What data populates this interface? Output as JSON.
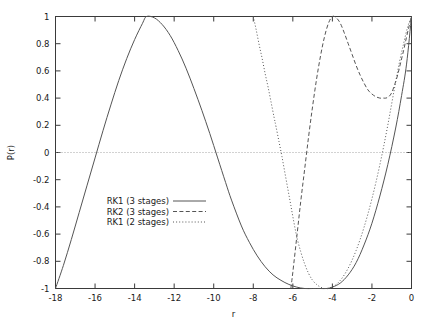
{
  "chart_data": {
    "type": "line",
    "title": "",
    "subtitle": "",
    "xlabel": "r",
    "ylabel": "P(r)",
    "xlim": [
      -18,
      0
    ],
    "ylim": [
      -1,
      1
    ],
    "grid": false,
    "zero_line": true,
    "legend_position": "center-left-inside",
    "xticks": [
      -18,
      -16,
      -14,
      -12,
      -10,
      -8,
      -6,
      -4,
      -2,
      0
    ],
    "xtick_labels": [
      "-18",
      "-16",
      "-14",
      "-12",
      "-10",
      "-8",
      "-6",
      "-4",
      "-2",
      "0"
    ],
    "yticks": [
      -1,
      -0.8,
      -0.6,
      -0.4,
      -0.2,
      0,
      0.2,
      0.4,
      0.6,
      0.8,
      1
    ],
    "ytick_labels": [
      "-1",
      "-0.8",
      "-0.6",
      "-0.4",
      "-0.2",
      "0",
      "0.2",
      "0.4",
      "0.6",
      "0.8",
      "1"
    ],
    "series": [
      {
        "name": "RK1 (3 stages)",
        "style": "solid",
        "color": "#555555",
        "points": [
          [
            -18,
            -1.0
          ],
          [
            -17.6,
            -0.83
          ],
          [
            -17.2,
            -0.64
          ],
          [
            -16.8,
            -0.44
          ],
          [
            -16.4,
            -0.24
          ],
          [
            -16.0,
            -0.04
          ],
          [
            -15.6,
            0.16
          ],
          [
            -15.2,
            0.35
          ],
          [
            -14.8,
            0.53
          ],
          [
            -14.4,
            0.69
          ],
          [
            -14.0,
            0.83
          ],
          [
            -13.6,
            0.95
          ],
          [
            -13.4,
            1.0
          ],
          [
            -13.0,
            0.99
          ],
          [
            -12.6,
            0.94
          ],
          [
            -12.2,
            0.86
          ],
          [
            -11.8,
            0.75
          ],
          [
            -11.4,
            0.62
          ],
          [
            -11.0,
            0.47
          ],
          [
            -10.6,
            0.31
          ],
          [
            -10.2,
            0.14
          ],
          [
            -9.8,
            -0.04
          ],
          [
            -9.4,
            -0.22
          ],
          [
            -9.1,
            -0.35
          ],
          [
            -8.6,
            -0.54
          ],
          [
            -8.2,
            -0.66
          ],
          [
            -7.8,
            -0.76
          ],
          [
            -7.4,
            -0.84
          ],
          [
            -7.0,
            -0.9
          ],
          [
            -6.6,
            -0.94
          ],
          [
            -6.2,
            -0.97
          ],
          [
            -5.8,
            -0.99
          ],
          [
            -5.4,
            -1.0
          ],
          [
            -5.0,
            -1.0
          ],
          [
            -4.6,
            -1.0
          ],
          [
            -4.3,
            -1.0
          ],
          [
            -4.0,
            -0.99
          ],
          [
            -3.6,
            -0.96
          ],
          [
            -3.2,
            -0.9
          ],
          [
            -2.8,
            -0.81
          ],
          [
            -2.4,
            -0.68
          ],
          [
            -2.0,
            -0.52
          ],
          [
            -1.6,
            -0.32
          ],
          [
            -1.2,
            -0.09
          ],
          [
            -0.8,
            0.18
          ],
          [
            -0.5,
            0.42
          ],
          [
            -0.25,
            0.65
          ],
          [
            0,
            1.0
          ]
        ]
      },
      {
        "name": "RK2 (3 stages)",
        "style": "dashed",
        "color": "#555555",
        "points": [
          [
            -6.1,
            -1.0
          ],
          [
            -6.0,
            -0.88
          ],
          [
            -5.8,
            -0.62
          ],
          [
            -5.6,
            -0.36
          ],
          [
            -5.4,
            -0.12
          ],
          [
            -5.2,
            0.12
          ],
          [
            -5.0,
            0.34
          ],
          [
            -4.8,
            0.54
          ],
          [
            -4.6,
            0.71
          ],
          [
            -4.4,
            0.85
          ],
          [
            -4.2,
            0.95
          ],
          [
            -4.0,
            1.0
          ],
          [
            -3.8,
            0.99
          ],
          [
            -3.6,
            0.95
          ],
          [
            -3.4,
            0.88
          ],
          [
            -3.2,
            0.8
          ],
          [
            -3.0,
            0.72
          ],
          [
            -2.8,
            0.64
          ],
          [
            -2.6,
            0.57
          ],
          [
            -2.4,
            0.51
          ],
          [
            -2.2,
            0.46
          ],
          [
            -2.0,
            0.43
          ],
          [
            -1.8,
            0.41
          ],
          [
            -1.6,
            0.4
          ],
          [
            -1.4,
            0.4
          ],
          [
            -1.3,
            0.4
          ],
          [
            -1.15,
            0.41
          ],
          [
            -1.0,
            0.44
          ],
          [
            -0.85,
            0.5
          ],
          [
            -0.7,
            0.57
          ],
          [
            -0.55,
            0.66
          ],
          [
            -0.4,
            0.75
          ],
          [
            -0.25,
            0.85
          ],
          [
            -0.12,
            0.93
          ],
          [
            0,
            1.0
          ]
        ]
      },
      {
        "name": "RK1 (2 stages)",
        "style": "dotted",
        "color": "#555555",
        "points": [
          [
            -8.0,
            1.0
          ],
          [
            -7.85,
            0.9
          ],
          [
            -7.7,
            0.79
          ],
          [
            -7.55,
            0.69
          ],
          [
            -7.4,
            0.58
          ],
          [
            -7.25,
            0.48
          ],
          [
            -7.1,
            0.37
          ],
          [
            -6.95,
            0.26
          ],
          [
            -6.85,
            0.19
          ],
          [
            -6.7,
            0.08
          ],
          [
            -6.55,
            -0.03
          ],
          [
            -6.4,
            -0.15
          ],
          [
            -6.25,
            -0.27
          ],
          [
            -6.1,
            -0.39
          ],
          [
            -5.95,
            -0.51
          ],
          [
            -5.8,
            -0.62
          ],
          [
            -5.6,
            -0.73
          ],
          [
            -5.4,
            -0.82
          ],
          [
            -5.2,
            -0.89
          ],
          [
            -5.0,
            -0.94
          ],
          [
            -4.8,
            -0.97
          ],
          [
            -4.6,
            -0.99
          ],
          [
            -4.4,
            -1.0
          ],
          [
            -4.2,
            -1.0
          ],
          [
            -4.0,
            -0.99
          ],
          [
            -3.8,
            -0.97
          ],
          [
            -3.6,
            -0.94
          ],
          [
            -3.4,
            -0.9
          ],
          [
            -3.2,
            -0.85
          ],
          [
            -3.0,
            -0.79
          ],
          [
            -2.8,
            -0.72
          ],
          [
            -2.6,
            -0.64
          ],
          [
            -2.4,
            -0.55
          ],
          [
            -2.2,
            -0.45
          ],
          [
            -2.0,
            -0.34
          ],
          [
            -1.8,
            -0.22
          ],
          [
            -1.6,
            -0.09
          ],
          [
            -1.4,
            0.05
          ],
          [
            -1.2,
            0.2
          ],
          [
            -1.0,
            0.36
          ],
          [
            -0.8,
            0.52
          ],
          [
            -0.6,
            0.67
          ],
          [
            -0.4,
            0.8
          ],
          [
            -0.2,
            0.92
          ],
          [
            0,
            1.0
          ]
        ]
      }
    ]
  },
  "legend": {
    "entries": [
      {
        "label": "RK1 (3 stages)",
        "style": "solid"
      },
      {
        "label": "RK2 (3 stages)",
        "style": "dashed"
      },
      {
        "label": "RK1 (2 stages)",
        "style": "dotted"
      }
    ]
  }
}
